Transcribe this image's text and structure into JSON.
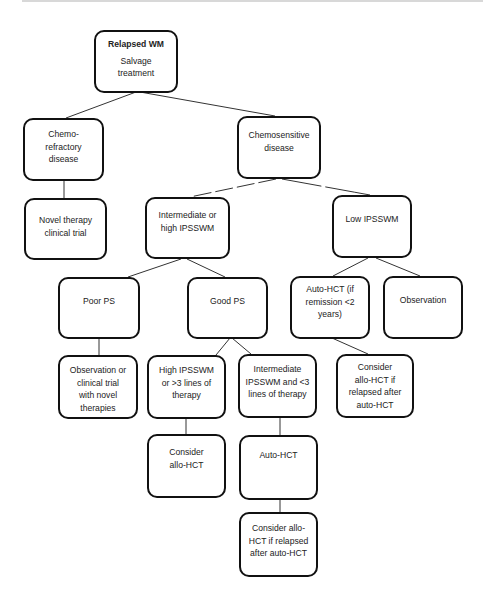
{
  "diagram": {
    "type": "flowchart",
    "title": "Relapsed WM",
    "nodes": {
      "root": {
        "title": "Relapsed WM",
        "text": "Salvage\ntreatment"
      },
      "chemo_refractory": {
        "text": "Chemo-\nrefractory\ndisease"
      },
      "chemosensitive": {
        "text": "Chemosensitive\ndisease"
      },
      "novel_therapy": {
        "text": "Novel therapy\nclinical trial"
      },
      "intermediate_high": {
        "text": "Intermediate or\nhigh IPSSWM"
      },
      "low_ipsswm": {
        "text": "Low IPSSWM"
      },
      "poor_ps": {
        "text": "Poor PS"
      },
      "good_ps": {
        "text": "Good PS"
      },
      "auto_hct_remission": {
        "text": "Auto-HCT (if\nremission <2\nyears)"
      },
      "observation": {
        "text": "Observation"
      },
      "observation_trial": {
        "text": "Observation or\nclinical trial\nwith novel\ntherapies"
      },
      "high_ipsswm_lines": {
        "text": "High IPSSWM\nor >3 lines of\ntherapy"
      },
      "intermediate_lines": {
        "text": "Intermediate\nIPSSWM and <3\nlines of therapy"
      },
      "consider_allo_relapsed_right": {
        "text": "Consider\nallo-HCT if\nrelapsed after\nauto-HCT"
      },
      "consider_allo": {
        "text": "Consider\nallo-HCT"
      },
      "auto_hct": {
        "text": "Auto-HCT"
      },
      "consider_allo_relapsed_bottom": {
        "text": "Consider allo-\nHCT if relapsed\nafter auto-HCT"
      }
    },
    "edges": [
      [
        "root",
        "chemo_refractory"
      ],
      [
        "root",
        "chemosensitive"
      ],
      [
        "chemo_refractory",
        "novel_therapy"
      ],
      [
        "chemosensitive",
        "intermediate_high"
      ],
      [
        "chemosensitive",
        "low_ipsswm"
      ],
      [
        "intermediate_high",
        "poor_ps"
      ],
      [
        "intermediate_high",
        "good_ps"
      ],
      [
        "low_ipsswm",
        "auto_hct_remission"
      ],
      [
        "low_ipsswm",
        "observation"
      ],
      [
        "poor_ps",
        "observation_trial"
      ],
      [
        "good_ps",
        "high_ipsswm_lines"
      ],
      [
        "good_ps",
        "intermediate_lines"
      ],
      [
        "auto_hct_remission",
        "consider_allo_relapsed_right"
      ],
      [
        "high_ipsswm_lines",
        "consider_allo"
      ],
      [
        "intermediate_lines",
        "auto_hct"
      ],
      [
        "auto_hct",
        "consider_allo_relapsed_bottom"
      ]
    ],
    "colors": {
      "border": "#111111",
      "line": "#333333",
      "background": "#ffffff",
      "text": "#222222"
    }
  }
}
